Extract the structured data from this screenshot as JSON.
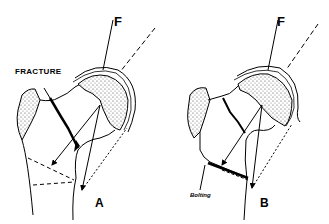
{
  "diagram": {
    "panels": [
      {
        "id": "A",
        "label": "A",
        "force_label": "F",
        "annotation": "FRACTURE"
      },
      {
        "id": "B",
        "label": "B",
        "force_label": "F",
        "annotation": "Bolting"
      }
    ],
    "colors": {
      "line": "#000000",
      "background": "#ffffff",
      "stipple": "#555555"
    }
  }
}
